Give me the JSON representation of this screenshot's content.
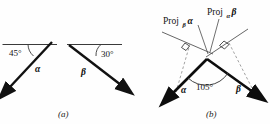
{
  "figure": {
    "background_color": "#fefefe",
    "stroke_color": "#111111",
    "thin_stroke_color": "#444444",
    "dashed_stroke_color": "#777777"
  },
  "panel_a": {
    "caption": "(a)",
    "items": [
      {
        "vector_label": "α",
        "angle_label": "45°",
        "reference": "horizontal-line",
        "direction": "down-left"
      },
      {
        "vector_label": "β",
        "angle_label": "30°",
        "reference": "horizontal-line",
        "direction": "down-right"
      }
    ]
  },
  "panel_b": {
    "caption": "(b)",
    "angle_label": "105°",
    "vectors": [
      {
        "label": "α",
        "direction": "down-left"
      },
      {
        "label": "β",
        "direction": "down-right"
      }
    ],
    "projections": [
      {
        "name": "proj-beta-alpha",
        "prefix": "Proj",
        "subscript": "β",
        "operand": "α",
        "right_angle_mark": true
      },
      {
        "name": "proj-alpha-beta",
        "prefix": "Proj",
        "subscript": "α",
        "operand": "β",
        "right_angle_mark": true
      }
    ]
  }
}
